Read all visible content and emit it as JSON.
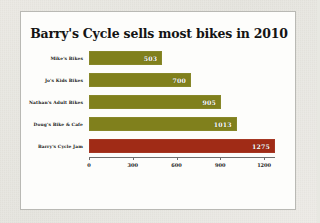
{
  "chart_data": {
    "type": "bar",
    "orientation": "horizontal",
    "title": "Barry's Cycle sells most bikes in 2010",
    "xlabel": "",
    "ylabel": "",
    "xlim": [
      0,
      1275
    ],
    "grid": false,
    "legend": null,
    "xticks": [
      "0",
      "300",
      "600",
      "900",
      "1200"
    ],
    "xtick_values": [
      0,
      300,
      600,
      900,
      1200
    ],
    "categories": [
      "Mike's Bikes",
      "Jo's Kids Bikes",
      "Nathan's Adult Bikes",
      "Doug's Bike & Cafe",
      "Barry's Cycle Jam"
    ],
    "values": [
      503,
      700,
      905,
      1013,
      1275
    ],
    "value_labels": [
      "503",
      "700",
      "905",
      "1013",
      "1275"
    ],
    "colors": [
      "#80801c",
      "#80801c",
      "#80801c",
      "#80801c",
      "#a02b16"
    ],
    "highlight_index": 4,
    "bar_color": "#80801c",
    "highlight_color": "#a02b16",
    "background_color": "#fdfdfb",
    "mat_color": "#eceae4",
    "border_color": "#b9b9b4"
  }
}
